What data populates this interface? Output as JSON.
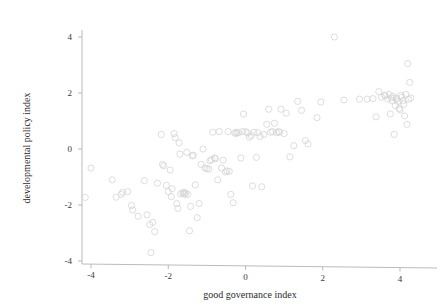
{
  "chart_data": {
    "type": "scatter",
    "title": "",
    "xlabel": "good governance index",
    "ylabel": "developmental policy index",
    "xlim": [
      -4.45,
      4.45
    ],
    "ylim": [
      -4.15,
      4.45
    ],
    "xticks": [
      -4,
      -2,
      0,
      2,
      4
    ],
    "yticks": [
      -4,
      -2,
      0,
      2,
      4
    ],
    "xtick_labels": [
      "-4",
      "-2",
      "0",
      "2",
      "4"
    ],
    "ytick_labels": [
      "-4",
      "-2",
      "0",
      "2",
      "4"
    ],
    "grid": false,
    "legend": false,
    "marker": "open-circle",
    "marker_color": "#d2d2d2",
    "marker_size": 3.1,
    "n_points": 132,
    "points": [
      [
        -4.15,
        -1.73
      ],
      [
        -4.0,
        -0.68
      ],
      [
        -3.45,
        -1.1
      ],
      [
        -3.35,
        -1.72
      ],
      [
        -3.22,
        -1.62
      ],
      [
        -3.18,
        -1.55
      ],
      [
        -3.05,
        -1.52
      ],
      [
        -2.95,
        -2.02
      ],
      [
        -2.92,
        -2.18
      ],
      [
        -2.78,
        -2.4
      ],
      [
        -2.62,
        -1.13
      ],
      [
        -2.55,
        -2.35
      ],
      [
        -2.48,
        -2.7
      ],
      [
        -2.45,
        -3.7
      ],
      [
        -2.4,
        -2.62
      ],
      [
        -2.35,
        -2.95
      ],
      [
        -2.28,
        -1.22
      ],
      [
        -2.18,
        0.52
      ],
      [
        -2.15,
        -0.55
      ],
      [
        -2.12,
        -0.6
      ],
      [
        -2.05,
        -1.3
      ],
      [
        -2.0,
        -1.52
      ],
      [
        -1.95,
        -0.75
      ],
      [
        -1.92,
        -1.7
      ],
      [
        -1.9,
        -1.42
      ],
      [
        -1.85,
        0.55
      ],
      [
        -1.82,
        0.4
      ],
      [
        -1.78,
        -1.95
      ],
      [
        -1.75,
        -2.12
      ],
      [
        -1.72,
        0.22
      ],
      [
        -1.7,
        -0.18
      ],
      [
        -1.68,
        -1.6
      ],
      [
        -1.62,
        -1.58
      ],
      [
        -1.6,
        -1.55
      ],
      [
        -1.58,
        -1.62
      ],
      [
        -1.55,
        -1.57
      ],
      [
        -1.52,
        -0.12
      ],
      [
        -1.5,
        -1.62
      ],
      [
        -1.45,
        -2.92
      ],
      [
        -1.42,
        -2.05
      ],
      [
        -1.38,
        -0.25
      ],
      [
        -1.35,
        -0.22
      ],
      [
        -1.3,
        -1.28
      ],
      [
        -1.25,
        -2.45
      ],
      [
        -1.2,
        -1.95
      ],
      [
        -1.15,
        -0.55
      ],
      [
        -1.1,
        0.0
      ],
      [
        -1.05,
        -0.68
      ],
      [
        -1.0,
        -0.7
      ],
      [
        -0.95,
        -0.72
      ],
      [
        -0.92,
        -0.42
      ],
      [
        -0.88,
        -0.38
      ],
      [
        -0.85,
        0.6
      ],
      [
        -0.8,
        -0.32
      ],
      [
        -0.78,
        -0.35
      ],
      [
        -0.72,
        -1.1
      ],
      [
        -0.68,
        0.62
      ],
      [
        -0.62,
        -0.68
      ],
      [
        -0.58,
        -0.4
      ],
      [
        -0.52,
        -0.82
      ],
      [
        -0.48,
        -0.78
      ],
      [
        -0.45,
        0.62
      ],
      [
        -0.42,
        -0.8
      ],
      [
        -0.38,
        -1.62
      ],
      [
        -0.32,
        -1.92
      ],
      [
        -0.28,
        0.58
      ],
      [
        -0.25,
        0.55
      ],
      [
        -0.22,
        0.6
      ],
      [
        -0.18,
        0.58
      ],
      [
        -0.12,
        -0.32
      ],
      [
        -0.08,
        0.62
      ],
      [
        -0.05,
        1.25
      ],
      [
        0.0,
        0.62
      ],
      [
        0.05,
        0.58
      ],
      [
        0.1,
        0.42
      ],
      [
        0.15,
        0.48
      ],
      [
        0.18,
        -1.32
      ],
      [
        0.22,
        0.6
      ],
      [
        0.28,
        -0.3
      ],
      [
        0.32,
        0.58
      ],
      [
        0.38,
        0.45
      ],
      [
        0.42,
        -1.35
      ],
      [
        0.48,
        0.52
      ],
      [
        0.55,
        0.88
      ],
      [
        0.6,
        1.42
      ],
      [
        0.65,
        0.6
      ],
      [
        0.7,
        0.62
      ],
      [
        0.75,
        0.92
      ],
      [
        0.8,
        0.58
      ],
      [
        0.85,
        0.62
      ],
      [
        0.88,
        0.6
      ],
      [
        0.92,
        1.42
      ],
      [
        1.0,
        0.55
      ],
      [
        1.05,
        1.28
      ],
      [
        1.15,
        -0.28
      ],
      [
        1.25,
        0.12
      ],
      [
        1.35,
        1.7
      ],
      [
        1.45,
        1.38
      ],
      [
        1.55,
        0.3
      ],
      [
        1.62,
        0.18
      ],
      [
        1.85,
        1.12
      ],
      [
        1.95,
        1.68
      ],
      [
        2.3,
        4.0
      ],
      [
        2.55,
        1.75
      ],
      [
        3.15,
        1.78
      ],
      [
        3.45,
        2.05
      ],
      [
        3.52,
        1.85
      ],
      [
        3.6,
        1.92
      ],
      [
        3.62,
        1.9
      ],
      [
        3.68,
        1.78
      ],
      [
        3.72,
        1.95
      ],
      [
        3.75,
        1.25
      ],
      [
        3.78,
        1.82
      ],
      [
        3.8,
        1.72
      ],
      [
        3.82,
        1.88
      ],
      [
        3.85,
        0.52
      ],
      [
        3.88,
        1.55
      ],
      [
        3.9,
        1.82
      ],
      [
        3.92,
        1.78
      ],
      [
        3.95,
        1.7
      ],
      [
        3.98,
        1.45
      ],
      [
        4.0,
        1.4
      ],
      [
        4.02,
        1.92
      ],
      [
        4.05,
        1.85
      ],
      [
        4.08,
        1.72
      ],
      [
        4.1,
        1.6
      ],
      [
        4.12,
        1.18
      ],
      [
        4.15,
        1.95
      ],
      [
        4.18,
        0.88
      ],
      [
        4.2,
        3.05
      ],
      [
        4.22,
        1.78
      ],
      [
        4.25,
        2.38
      ],
      [
        4.28,
        1.82
      ],
      [
        3.38,
        1.15
      ],
      [
        3.3,
        1.8
      ],
      [
        2.95,
        1.78
      ]
    ]
  }
}
